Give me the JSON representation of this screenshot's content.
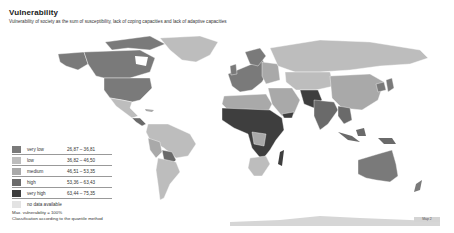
{
  "header": {
    "title": "Vulnerability",
    "subtitle": "Vulnerability of society as the sum of susceptibility, lack of coping capacities and lack of adaptive capacities"
  },
  "legend": {
    "classes": [
      {
        "label": "very low",
        "range": "26,87 – 36,81",
        "color": "#7a7a7a"
      },
      {
        "label": "low",
        "range": "36,82 – 46,50",
        "color": "#bdbdbd"
      },
      {
        "label": "medium",
        "range": "46,51 – 53,35",
        "color": "#a9a9a9"
      },
      {
        "label": "high",
        "range": "53,36 – 63,43",
        "color": "#6a6a6a"
      },
      {
        "label": "very high",
        "range": "63,44 – 75,35",
        "color": "#3e3e3e"
      }
    ],
    "no_data": {
      "label": "no data available",
      "color": "#e3e3e3"
    }
  },
  "notes": {
    "line1": "Max. vulnerability = 100%",
    "line2": "Classification according to the quantile method"
  },
  "map_tag": "Map 2",
  "colors": {
    "ocean": "#ffffff",
    "very_low": "#7a7a7a",
    "low": "#bdbdbd",
    "medium": "#a9a9a9",
    "high": "#6a6a6a",
    "very_high": "#3e3e3e",
    "no_data": "#e3e3e3"
  }
}
